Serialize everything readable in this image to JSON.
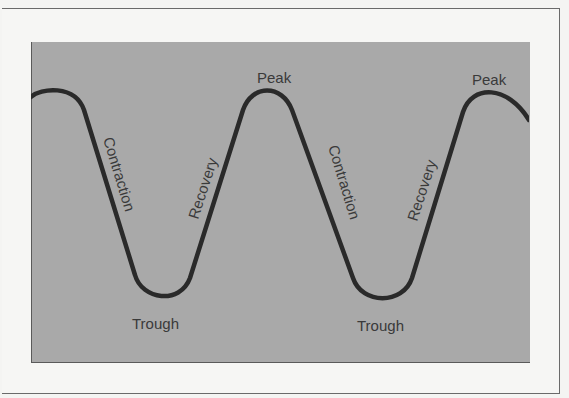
{
  "diagram": {
    "type": "business-cycle",
    "labels": {
      "peak_1": "Peak",
      "peak_2": "Peak",
      "trough_1": "Trough",
      "trough_2": "Trough",
      "contraction_1": "Contraction",
      "contraction_2": "Contraction",
      "recovery_1": "Recovery",
      "recovery_2": "Recovery"
    },
    "colors": {
      "background": "#f4f4f2",
      "panel": "#a9a9a9",
      "curve": "#2a2a2a",
      "text": "#3a3a3a"
    }
  }
}
